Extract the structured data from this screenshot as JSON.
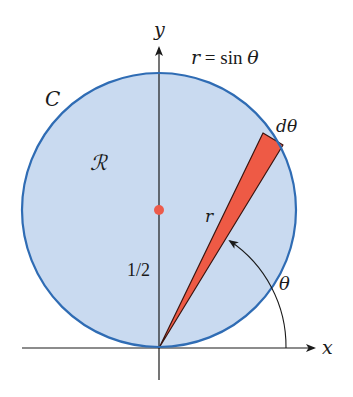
{
  "diagram": {
    "type": "polar-area-diagram",
    "curve_label": "C",
    "region_label": "ℛ",
    "equation": {
      "lhs": "r",
      "eq": " = ",
      "fn": "sin ",
      "var": "θ"
    },
    "axis_labels": {
      "x": "x",
      "y": "y"
    },
    "radius_label": "r",
    "center_label": "1/2",
    "angle_label": "θ",
    "wedge_angle_label": "dθ",
    "colors": {
      "region_fill": "#c9daf0",
      "circle_stroke": "#2f6cb4",
      "wedge_fill": "#ee5a45",
      "wedge_stroke": "#3a1510",
      "center_dot": "#ec5b4b",
      "axis": "#1a1a1a"
    },
    "geometry": {
      "origin": [
        159,
        348
      ],
      "circle_center": [
        159,
        210
      ],
      "circle_radius": 137,
      "center_dot_radius": 5,
      "angle_arc_radius": 127
    }
  }
}
